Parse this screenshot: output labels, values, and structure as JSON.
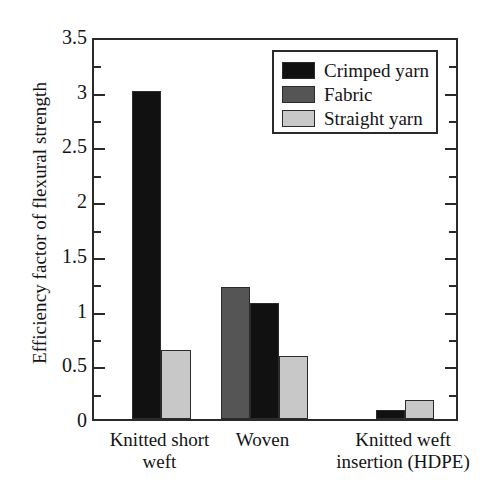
{
  "chart_data": {
    "type": "bar",
    "title": "",
    "subtitle": "",
    "xlabel": "",
    "ylabel": "Efficiency factor of flexural strength",
    "ylim": [
      0,
      3.5
    ],
    "ytick_labels": [
      "0",
      "0.5",
      "1",
      "1.5",
      "2",
      "2.5",
      "3",
      "3.5"
    ],
    "ytick_values": [
      0,
      0.5,
      1,
      1.5,
      2,
      2.5,
      3,
      3.5
    ],
    "yminor_step": 0.25,
    "grid": false,
    "legend_position": "top-right",
    "categories": [
      "Knitted short\nweft",
      "Woven",
      "Knitted weft\ninsertion (HDPE)"
    ],
    "category_lines": [
      [
        "Knitted short",
        "weft"
      ],
      [
        "Woven",
        ""
      ],
      [
        "Knitted weft",
        "insertion (HDPE)"
      ]
    ],
    "series": [
      {
        "name": "Crimped yarn",
        "color": "#111111",
        "values": [
          3.0,
          1.06,
          0.08
        ]
      },
      {
        "name": "Fabric",
        "color": "#555555",
        "values": [
          null,
          1.21,
          null
        ]
      },
      {
        "name": "Straight yarn",
        "color": "#c8c8c8",
        "values": [
          0.63,
          0.58,
          0.17
        ]
      }
    ],
    "bars": [
      {
        "group": "Knitted short weft",
        "series": "Crimped yarn",
        "value": 3.0,
        "color": "#111111",
        "x": 130,
        "width": 29
      },
      {
        "group": "Knitted short weft",
        "series": "Straight yarn",
        "value": 0.63,
        "color": "#c8c8c8",
        "x": 159,
        "width": 30
      },
      {
        "group": "Woven",
        "series": "Fabric",
        "value": 1.21,
        "color": "#555555",
        "x": 219,
        "width": 29
      },
      {
        "group": "Woven",
        "series": "Crimped yarn",
        "value": 1.06,
        "color": "#111111",
        "x": 248,
        "width": 29
      },
      {
        "group": "Woven",
        "series": "Straight yarn",
        "value": 0.58,
        "color": "#c8c8c8",
        "x": 277,
        "width": 29
      },
      {
        "group": "Knitted weft insertion (HDPE)",
        "series": "Crimped yarn",
        "value": 0.08,
        "color": "#111111",
        "x": 374,
        "width": 29
      },
      {
        "group": "Knitted weft insertion (HDPE)",
        "series": "Straight yarn",
        "value": 0.17,
        "color": "#c8c8c8",
        "x": 403,
        "width": 29
      }
    ],
    "legend": [
      {
        "label": "Crimped yarn",
        "color": "#111111"
      },
      {
        "label": "Fabric",
        "color": "#555555"
      },
      {
        "label": "Straight yarn",
        "color": "#c8c8c8"
      }
    ],
    "colors": {
      "axis": "#2a2a2a",
      "text": "#141414",
      "background": "#ffffff",
      "crimped_yarn": "#111111",
      "fabric": "#555555",
      "straight_yarn": "#c8c8c8"
    }
  }
}
